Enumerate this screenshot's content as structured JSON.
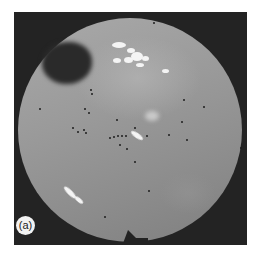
{
  "figure": {
    "panel_label": "(a)",
    "colors": {
      "frame": "#232323",
      "disc_light": "#a9a9a9",
      "disc_dark": "#7f7f7f",
      "highlight": "#f4f4f4",
      "dots": "#1e1e1e"
    }
  }
}
